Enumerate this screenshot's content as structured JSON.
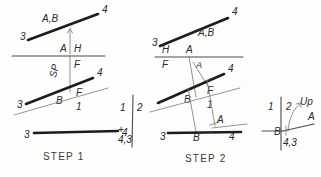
{
  "figure": {
    "background_color": "#fdfdfc",
    "ink_color": "#1d1d1d",
    "light_ink_color": "#8a8a8a"
  },
  "captions": {
    "step1": "STEP  1",
    "step2": "STEP  2"
  },
  "step1": {
    "top_view": {
      "labels": {
        "end_left": "3",
        "end_right": "4",
        "line_name": "A,B"
      }
    },
    "fold_line": {
      "labels": {
        "left_of_mark": "A",
        "above_left": "H",
        "below_right": "F"
      },
      "vertical_label": "SP"
    },
    "front_view": {
      "labels": {
        "end_left": "3",
        "end_right": "4",
        "point_b": "B",
        "plane_f": "F",
        "plane_1": "1"
      }
    },
    "bottom_line": {
      "labels": {
        "end_left": "3",
        "end_right": "4"
      }
    }
  },
  "aux_middle": {
    "labels": {
      "left_number": "1",
      "right_number": "2",
      "plus_mark": "+",
      "point_label": "4,3"
    }
  },
  "step2": {
    "top_view": {
      "labels": {
        "end_left": "3",
        "end_right": "4",
        "line_name": "A,B"
      }
    },
    "fold_line": {
      "labels": {
        "above_left": "H",
        "above_right": "A",
        "below_left": "F",
        "inner_point": "A"
      }
    },
    "front_view": {
      "labels": {
        "end_right": "4",
        "point_b": "B",
        "plane_f": "F",
        "plane_1": "1",
        "point_a": "A"
      }
    },
    "bottom_line": {
      "labels": {
        "end_left": "3",
        "point_b": "B",
        "end_right": "4"
      }
    }
  },
  "aux_right": {
    "labels": {
      "left_number": "1",
      "right_number": "2",
      "direction": "Up",
      "point_a": "A",
      "point_b": "B",
      "point_label": "4,3"
    }
  }
}
